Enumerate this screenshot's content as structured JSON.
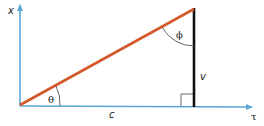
{
  "diagram": {
    "labels": {
      "x_axis": "x",
      "t_axis": "τ",
      "theta": "θ",
      "phi": "ϕ",
      "v": "v",
      "c": "c"
    },
    "colors": {
      "axis": "#5aa6d6",
      "hypotenuse": "#d4582a",
      "vertical_side": "#111111",
      "arc": "#555555"
    }
  }
}
